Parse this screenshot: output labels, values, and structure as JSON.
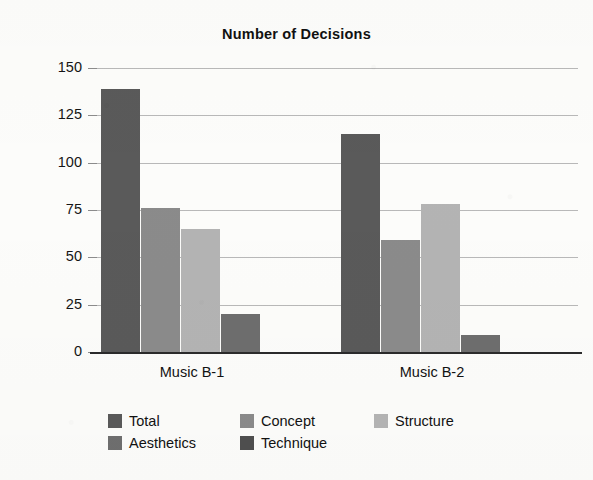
{
  "chart_data": {
    "type": "bar",
    "title": "Number of Decisions",
    "xlabel": "",
    "ylabel": "",
    "categories": [
      "Music B-1",
      "Music B-2"
    ],
    "series": [
      {
        "name": "Total",
        "color": "#5a5a5a",
        "values": [
          139,
          115
        ]
      },
      {
        "name": "Concept",
        "color": "#8b8b8b",
        "values": [
          76,
          59
        ]
      },
      {
        "name": "Structure",
        "color": "#b4b4b4",
        "values": [
          65,
          78
        ]
      },
      {
        "name": "Technique",
        "color": "#6e6e6e",
        "values": [
          20,
          9
        ]
      }
    ],
    "legend_entries": [
      {
        "label": "Total",
        "color": "#5a5a5a"
      },
      {
        "label": "Concept",
        "color": "#8b8b8b"
      },
      {
        "label": "Structure",
        "color": "#b4b4b4"
      },
      {
        "label": "Aesthetics",
        "color": "#6f6f6f"
      },
      {
        "label": "Technique",
        "color": "#4f4f4f"
      }
    ],
    "legend_position": "bottom",
    "ylim": [
      0,
      150
    ],
    "yticks": [
      "0",
      "25",
      "50",
      "75",
      "100",
      "125",
      "150"
    ],
    "grid": true
  },
  "axis": {
    "y_ticks": [
      "150",
      "125",
      "100",
      "75",
      "50",
      "25",
      "0"
    ]
  },
  "legend": {
    "row1": [
      "Total",
      "Concept",
      "Structure"
    ],
    "row2": [
      "Aesthetics",
      "Technique"
    ]
  }
}
